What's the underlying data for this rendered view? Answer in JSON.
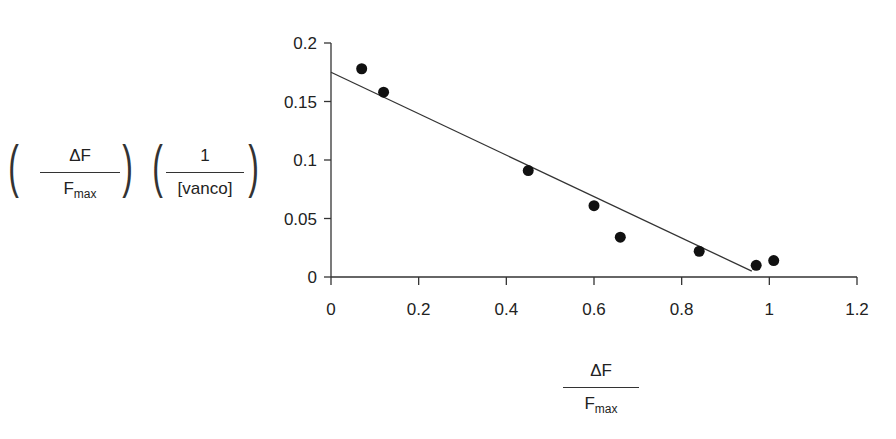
{
  "chart_data": {
    "type": "scatter",
    "title": "",
    "xlabel": "ΔF / Fmax",
    "ylabel": "(ΔF / Fmax)(1 / [vanco])",
    "xlim": [
      0,
      1.2
    ],
    "ylim": [
      0,
      0.2
    ],
    "x_ticks": [
      "0",
      "0.2",
      "0.4",
      "0.6",
      "0.8",
      "1",
      "1.2"
    ],
    "y_ticks": [
      "0",
      "0.05",
      "0.1",
      "0.15",
      "0.2"
    ],
    "grid": false,
    "points": [
      {
        "x": 0.07,
        "y": 0.178
      },
      {
        "x": 0.12,
        "y": 0.158
      },
      {
        "x": 0.45,
        "y": 0.091
      },
      {
        "x": 0.6,
        "y": 0.061
      },
      {
        "x": 0.66,
        "y": 0.034
      },
      {
        "x": 0.84,
        "y": 0.022
      },
      {
        "x": 0.97,
        "y": 0.01
      },
      {
        "x": 1.01,
        "y": 0.014
      }
    ],
    "fit_line": {
      "x1": 0.0,
      "y1": 0.175,
      "x2": 0.96,
      "y2": 0.005
    }
  },
  "labels": {
    "y_frac1_num": "ΔF",
    "y_frac1_den_main": "F",
    "y_frac1_den_sub": "max",
    "y_frac2_num": "1",
    "y_frac2_den": "[vanco]",
    "x_num": "ΔF",
    "x_den_main": "F",
    "x_den_sub": "max"
  }
}
